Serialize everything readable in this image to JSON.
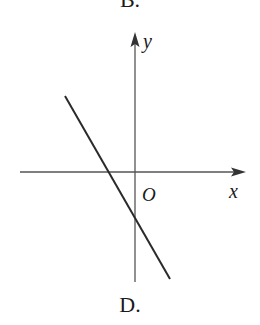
{
  "options": {
    "previous_label": "B.",
    "current_label": "D."
  },
  "axes": {
    "x_label": "x",
    "y_label": "y",
    "origin_label": "O"
  },
  "colors": {
    "axis": "#555555",
    "line": "#2a2a2a",
    "text": "#1a1a1a"
  },
  "graph": {
    "description": "Straight line with negative slope, negative y-intercept, negative x-intercept",
    "line_start": [
      65,
      96
    ],
    "line_end": [
      170,
      279
    ],
    "x_intercept_px": [
      105,
      172
    ],
    "y_intercept_px": [
      135,
      225
    ]
  }
}
